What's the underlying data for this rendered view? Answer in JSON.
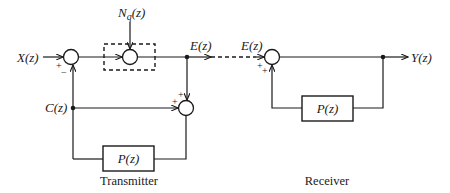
{
  "diagram": {
    "type": "block-diagram",
    "signals": {
      "input": "X(z)",
      "noise": "N",
      "noise_sub": "q",
      "noise_arg": "(z)",
      "error_tx": "E(z)",
      "error_rx": "E(z)",
      "feedback": "C(z)",
      "output": "Y(z)"
    },
    "blocks": {
      "tx_filter": "P(z)",
      "rx_filter": "P(z)"
    },
    "captions": {
      "transmitter": "Transmitter",
      "receiver": "Receiver"
    },
    "signs": {
      "sum1_plus": "+",
      "sum1_minus": "−",
      "sum3_plus_top": "+",
      "sum3_plus_left": "+",
      "rx_plus_a": "+",
      "rx_plus_b": "+"
    },
    "colors": {
      "line": "#1a1a1a",
      "background": "#ffffff"
    }
  }
}
